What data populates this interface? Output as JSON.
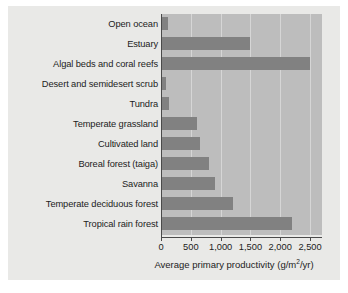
{
  "chart_data": {
    "type": "bar",
    "orientation": "horizontal",
    "title": "",
    "xlabel": "Average primary productivity (g/m2/yr)",
    "xlabel_parts": {
      "before": "Average primary productivity (g/m",
      "sup": "2",
      "after": "/yr)"
    },
    "ylabel": "",
    "categories": [
      "Open ocean",
      "Estuary",
      "Algal beds and coral reefs",
      "Desert and semidesert scrub",
      "Tundra",
      "Temperate grassland",
      "Cultivated land",
      "Boreal forest (taiga)",
      "Savanna",
      "Temperate deciduous forest",
      "Tropical rain forest"
    ],
    "values": [
      125,
      1500,
      2500,
      90,
      140,
      600,
      650,
      800,
      900,
      1200,
      2200
    ],
    "xlim": [
      0,
      2700
    ],
    "xticks": [
      0,
      500,
      1000,
      1500,
      2000,
      2500
    ],
    "xtick_labels": [
      "0",
      "500",
      "1,000",
      "1,500",
      "2,000",
      "2,500"
    ],
    "grid": "vertical",
    "legend": "none",
    "colors": {
      "bar": "#818181",
      "plot_background": "#bdbdbd",
      "figure_background": "#e9e9e7",
      "gridline": "#d6d6d6",
      "axis": "#4a4a4a",
      "text": "#1c1c1c"
    }
  }
}
